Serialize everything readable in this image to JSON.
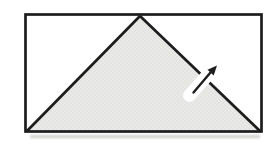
{
  "figure": {
    "background": "#ffffff",
    "stroke_color": "#1d1d1d",
    "fill_color": "#e9e9e7",
    "texture_dot_color": "#d9d9d6",
    "halo_color": "#ffffff",
    "shadow_color": "#9a9a97",
    "rectangle": {
      "x": "25.5",
      "y": "14.5",
      "width": "236",
      "height": "117"
    },
    "triangle": {
      "points": "26.5,131.5 140,16 260.5,131.5"
    },
    "left_edge": {
      "d": "M140,16 L26.5,131.5"
    },
    "hypotenuse": {
      "d": "M140,16 L260.5,131.5"
    },
    "arrow": {
      "icon": "northeast-arrow-icon",
      "halo_d": "M189.5,95.5 L213,69",
      "shaft_d": "M193.5,92.5 L210.5,72.5",
      "head_points": "217,65.5 213.7,75.4 207.5,69.7"
    },
    "scan_shadow": {
      "x": "30",
      "y": "135",
      "width": "230",
      "height": "3.2"
    }
  }
}
